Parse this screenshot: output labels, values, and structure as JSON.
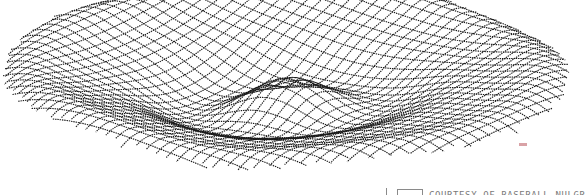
{
  "chart_data": {
    "type": "surface-wireframe",
    "title": "",
    "function": "z = cos(r*k) * rim profile over a circular domain",
    "grid": {
      "rows": 34,
      "cols": 46
    },
    "xlabel": "",
    "ylabel": "",
    "zlabel": "",
    "ink_color": "#1a1a1a",
    "background": "#ffffff",
    "legend": []
  },
  "caption": {
    "text": "COURTESY OF BASEBALL NULGR",
    "color": "#7a7a7a"
  }
}
